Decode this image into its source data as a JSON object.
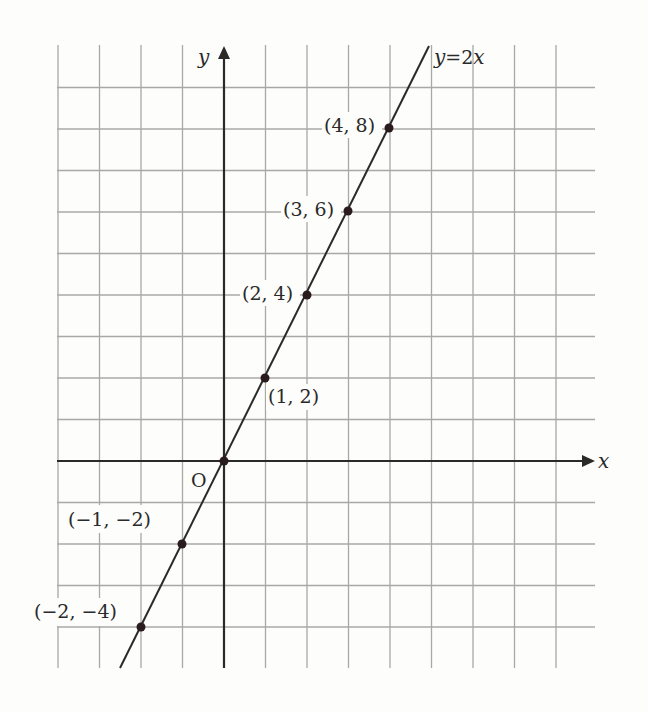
{
  "chart_data": {
    "type": "line",
    "title": "",
    "xlabel": "x",
    "ylabel": "y",
    "origin_label": "O",
    "grid": true,
    "xlim": [
      -4,
      8
    ],
    "ylim": [
      -5,
      10
    ],
    "series": [
      {
        "name": "y=2x",
        "equation": "y=2x",
        "x": [
          -2,
          -1,
          0,
          1,
          2,
          3,
          4
        ],
        "values": [
          -4,
          -2,
          0,
          2,
          4,
          6,
          8
        ]
      }
    ],
    "points": [
      {
        "x": 4,
        "y": 8,
        "label": "(4, 8)"
      },
      {
        "x": 3,
        "y": 6,
        "label": "(3, 6)"
      },
      {
        "x": 2,
        "y": 4,
        "label": "(2, 4)"
      },
      {
        "x": 1,
        "y": 2,
        "label": "(1, 2)"
      },
      {
        "x": 0,
        "y": 0,
        "label": "O"
      },
      {
        "x": -1,
        "y": -2,
        "label": "(−1,  −2)"
      },
      {
        "x": -2,
        "y": -4,
        "label": "(−2,  −4)"
      }
    ]
  },
  "colors": {
    "background": "#fdfdfb",
    "grid": "#a8a8a4",
    "axis": "#2a2a2a",
    "line": "#2a2a2a",
    "point": "#2a1c1c"
  },
  "labels": {
    "x_axis": "x",
    "y_axis": "y",
    "origin": "O",
    "line_eq_y": "y",
    "line_eq_eq": "=2",
    "line_eq_x": "x",
    "p48": "(4, 8)",
    "p36": "(3, 6)",
    "p24": "(2, 4)",
    "p12": "(1, 2)",
    "pm12": "(−1,  −2)",
    "pm24": "(−2,  −4)"
  }
}
